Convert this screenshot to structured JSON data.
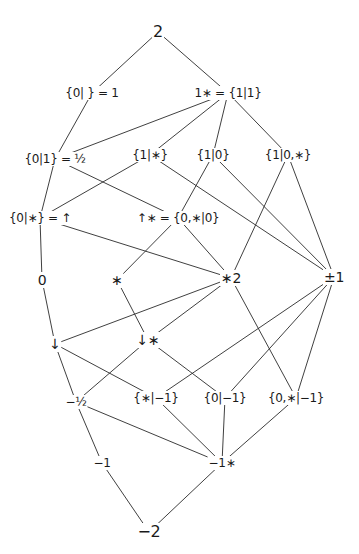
{
  "diagram": {
    "type": "hasse-lattice",
    "nodes": [
      {
        "id": "n2",
        "label": "2",
        "x": 158,
        "y": 32,
        "size": "big"
      },
      {
        "id": "n1",
        "label": "{0| } = 1",
        "x": 92,
        "y": 93,
        "size": ""
      },
      {
        "id": "n1star",
        "label": "1∗ = {1|1}",
        "x": 228,
        "y": 93,
        "size": ""
      },
      {
        "id": "nhalf",
        "label": "{0|1} = ½",
        "x": 55,
        "y": 159,
        "size": ""
      },
      {
        "id": "n1_star",
        "label": "{1|∗}",
        "x": 150,
        "y": 155,
        "size": ""
      },
      {
        "id": "n1_0",
        "label": "{1|0}",
        "x": 213,
        "y": 155,
        "size": ""
      },
      {
        "id": "n1_0star",
        "label": "{1|0,∗}",
        "x": 288,
        "y": 155,
        "size": ""
      },
      {
        "id": "nup",
        "label": "{0|∗} = ↑",
        "x": 40,
        "y": 218,
        "size": ""
      },
      {
        "id": "nupstar",
        "label": "↑∗ = {0,∗|0}",
        "x": 178,
        "y": 218,
        "size": ""
      },
      {
        "id": "n0",
        "label": "0",
        "x": 42,
        "y": 280,
        "size": "mid"
      },
      {
        "id": "nstar",
        "label": "∗",
        "x": 117,
        "y": 280,
        "size": "mid"
      },
      {
        "id": "nstar2",
        "label": "∗2",
        "x": 231,
        "y": 278,
        "size": "mid"
      },
      {
        "id": "npm1",
        "label": "±1",
        "x": 334,
        "y": 277,
        "size": "mid"
      },
      {
        "id": "ndown",
        "label": "↓",
        "x": 55,
        "y": 344,
        "size": "mid"
      },
      {
        "id": "ndownstar",
        "label": "↓∗",
        "x": 148,
        "y": 340,
        "size": "mid"
      },
      {
        "id": "nmhalf",
        "label": "−½",
        "x": 76,
        "y": 402,
        "size": ""
      },
      {
        "id": "nstar_m1",
        "label": "{∗|−1}",
        "x": 156,
        "y": 398,
        "size": ""
      },
      {
        "id": "n0_m1",
        "label": "{0|−1}",
        "x": 225,
        "y": 398,
        "size": ""
      },
      {
        "id": "n0star_m1",
        "label": "{0,∗|−1}",
        "x": 296,
        "y": 398,
        "size": ""
      },
      {
        "id": "nm1",
        "label": "−1",
        "x": 102,
        "y": 463,
        "size": ""
      },
      {
        "id": "nm1star",
        "label": "−1∗",
        "x": 222,
        "y": 463,
        "size": ""
      },
      {
        "id": "nm2",
        "label": "−2",
        "x": 149,
        "y": 532,
        "size": "big"
      }
    ],
    "edges": [
      [
        "n2",
        "n1"
      ],
      [
        "n2",
        "n1star"
      ],
      [
        "n1",
        "nhalf"
      ],
      [
        "n1star",
        "nhalf"
      ],
      [
        "n1star",
        "n1_star"
      ],
      [
        "n1star",
        "n1_0"
      ],
      [
        "n1star",
        "n1_0star"
      ],
      [
        "nhalf",
        "nup"
      ],
      [
        "nhalf",
        "nupstar"
      ],
      [
        "n1_star",
        "nup"
      ],
      [
        "n1_star",
        "npm1"
      ],
      [
        "n1_0",
        "nupstar"
      ],
      [
        "n1_0",
        "npm1"
      ],
      [
        "n1_0star",
        "nstar2"
      ],
      [
        "n1_0star",
        "npm1"
      ],
      [
        "nup",
        "n0"
      ],
      [
        "nup",
        "nstar2"
      ],
      [
        "nupstar",
        "nstar"
      ],
      [
        "nupstar",
        "nstar2"
      ],
      [
        "n0",
        "ndown"
      ],
      [
        "nstar",
        "ndownstar"
      ],
      [
        "nstar2",
        "ndown"
      ],
      [
        "nstar2",
        "ndownstar"
      ],
      [
        "nstar2",
        "n0star_m1"
      ],
      [
        "npm1",
        "nstar_m1"
      ],
      [
        "npm1",
        "n0_m1"
      ],
      [
        "npm1",
        "n0star_m1"
      ],
      [
        "ndown",
        "nmhalf"
      ],
      [
        "ndown",
        "nstar_m1"
      ],
      [
        "ndownstar",
        "nmhalf"
      ],
      [
        "ndownstar",
        "n0_m1"
      ],
      [
        "nmhalf",
        "nm1"
      ],
      [
        "nmhalf",
        "nm1star"
      ],
      [
        "nstar_m1",
        "nm1star"
      ],
      [
        "n0_m1",
        "nm1star"
      ],
      [
        "n0star_m1",
        "nm1star"
      ],
      [
        "nm1",
        "nm2"
      ],
      [
        "nm1star",
        "nm2"
      ]
    ],
    "colors": {
      "background": "#ffffff",
      "ink": "#1a1a1a"
    }
  }
}
